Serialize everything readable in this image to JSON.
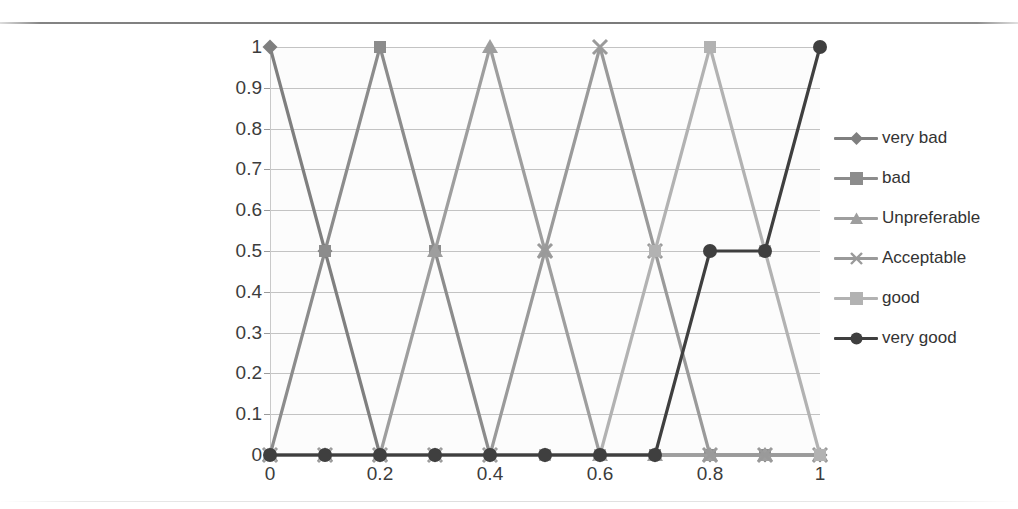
{
  "chart_data": {
    "type": "line",
    "title": "",
    "xlabel": "",
    "ylabel": "",
    "xlim": [
      0,
      1
    ],
    "ylim": [
      0,
      1
    ],
    "grid": true,
    "legend_position": "right",
    "x": [
      0,
      0.1,
      0.2,
      0.3,
      0.4,
      0.5,
      0.6,
      0.7,
      0.8,
      0.9,
      1
    ],
    "x_tick_labels": [
      "0",
      "0.2",
      "0.4",
      "0.6",
      "0.8",
      "1"
    ],
    "x_tick_values": [
      0,
      0.2,
      0.4,
      0.6,
      0.8,
      1
    ],
    "y_tick_labels": [
      "0",
      "0.1",
      "0.2",
      "0.3",
      "0.4",
      "0.5",
      "0.6",
      "0.7",
      "0.8",
      "0.9",
      "1"
    ],
    "y_tick_values": [
      0,
      0.1,
      0.2,
      0.3,
      0.4,
      0.5,
      0.6,
      0.7,
      0.8,
      0.9,
      1
    ],
    "series": [
      {
        "name": "very bad",
        "marker": "diamond",
        "color": "#7f7f7f",
        "values": [
          1,
          0.5,
          0,
          0,
          0,
          0,
          0,
          0,
          0,
          0,
          0
        ]
      },
      {
        "name": "bad",
        "marker": "square",
        "color": "#8c8c8c",
        "values": [
          0,
          0.5,
          1,
          0.5,
          0,
          0,
          0,
          0,
          0,
          0,
          0
        ]
      },
      {
        "name": "Unpreferable",
        "marker": "triangle",
        "color": "#9e9e9e",
        "values": [
          0,
          0,
          0,
          0.5,
          1,
          0.5,
          0,
          0,
          0,
          0,
          0
        ]
      },
      {
        "name": "Acceptable",
        "marker": "cross",
        "color": "#9a9a9a",
        "values": [
          0,
          0,
          0,
          0,
          0,
          0.5,
          1,
          0.5,
          0,
          0,
          0
        ]
      },
      {
        "name": "good",
        "marker": "square",
        "color": "#b2b2b2",
        "values": [
          0,
          0,
          0,
          0,
          0,
          0,
          0,
          0.5,
          1,
          0.5,
          0
        ]
      },
      {
        "name": "very good",
        "marker": "circle",
        "color": "#3f3f3f",
        "values": [
          0,
          0,
          0,
          0,
          0,
          0,
          0,
          0,
          0.5,
          0.5,
          1
        ]
      }
    ]
  },
  "legend": {
    "items": [
      {
        "label": "very bad"
      },
      {
        "label": "bad"
      },
      {
        "label": "Unpreferable"
      },
      {
        "label": "Acceptable"
      },
      {
        "label": "good"
      },
      {
        "label": "very good"
      }
    ]
  }
}
